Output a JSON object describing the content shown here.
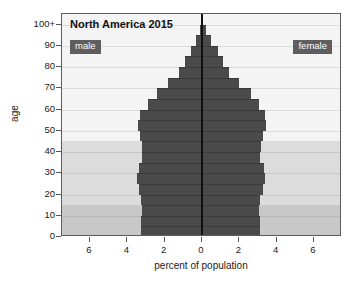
{
  "chart_data": {
    "type": "bar",
    "subtype": "population-pyramid",
    "title": "North America 2015",
    "xlabel": "percent of population",
    "ylabel": "age",
    "xlim": [
      -7.5,
      7.5
    ],
    "ylim": [
      0,
      105
    ],
    "grid": true,
    "xticks": [
      -6,
      -4,
      -2,
      0,
      2,
      4,
      6
    ],
    "xtick_labels": [
      "6",
      "4",
      "2",
      "0",
      "2",
      "4",
      "6"
    ],
    "yticks": [
      0,
      10,
      20,
      30,
      40,
      50,
      60,
      70,
      80,
      90,
      100
    ],
    "ytick_labels": [
      "0",
      "10",
      "20",
      "30",
      "40",
      "50",
      "60",
      "70",
      "80",
      "90",
      "100+"
    ],
    "legend": [
      "male",
      "female"
    ],
    "legend_position": "inside top-left and top-right",
    "categories": [
      "0-4",
      "5-9",
      "10-14",
      "15-19",
      "20-24",
      "25-29",
      "30-34",
      "35-39",
      "40-44",
      "45-49",
      "50-54",
      "55-59",
      "60-64",
      "65-69",
      "70-74",
      "75-79",
      "80-84",
      "85-89",
      "90-94",
      "95-99",
      "100+"
    ],
    "series": [
      {
        "name": "male",
        "side": "left",
        "values": [
          3.25,
          3.25,
          3.2,
          3.25,
          3.4,
          3.5,
          3.4,
          3.2,
          3.2,
          3.3,
          3.45,
          3.3,
          2.9,
          2.4,
          1.8,
          1.25,
          0.9,
          0.6,
          0.3,
          0.1,
          0.02
        ]
      },
      {
        "name": "female",
        "side": "right",
        "values": [
          3.1,
          3.1,
          3.05,
          3.1,
          3.25,
          3.35,
          3.3,
          3.1,
          3.15,
          3.25,
          3.45,
          3.4,
          3.05,
          2.6,
          2.0,
          1.45,
          1.15,
          0.85,
          0.5,
          0.2,
          0.05
        ]
      }
    ],
    "bands": [
      {
        "name": "youth-band",
        "from": 0,
        "to": 15,
        "color": "#c8c8c8"
      },
      {
        "name": "working-age-band",
        "from": 15,
        "to": 45,
        "color": "#dcdcdc"
      },
      {
        "name": "older-band",
        "from": 45,
        "to": 105,
        "color": "#f4f4f4"
      }
    ],
    "colors": {
      "bar": "#4a4a4a",
      "centerline": "#101010",
      "badge_bg": "#5e5e5e",
      "badge_text": "#ffffff",
      "frame": "#5c5c5c"
    }
  }
}
